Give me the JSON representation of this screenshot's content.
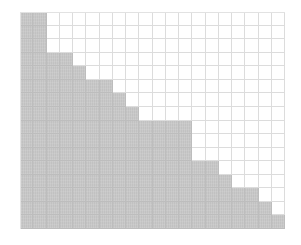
{
  "figure": {
    "columns": 20,
    "rows": 16,
    "filled_per_row": [
      2,
      2,
      2,
      4,
      5,
      7,
      8,
      9,
      13,
      13,
      13,
      15,
      16,
      18,
      19,
      20
    ],
    "colors": {
      "background": "#ffffff",
      "fill": "#c9c9c9",
      "grid_line": "#dcdcdc",
      "grid_line_filled": "#bdbdbd"
    }
  }
}
